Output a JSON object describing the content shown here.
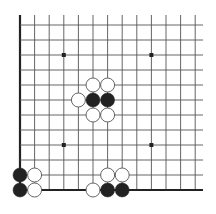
{
  "board": {
    "title": "Go board diagram (bottom-left corner)",
    "columns": 13,
    "rows": 12,
    "origin": {
      "x": 20,
      "y": 190
    },
    "spacing_x": 14.6,
    "spacing_y": 15,
    "grid_extend_right": 203,
    "grid_extend_top": 15,
    "edges": {
      "left": true,
      "bottom": true,
      "top": false,
      "right": false
    },
    "colors": {
      "background": "#ffffff",
      "grid_line": "#555555",
      "edge_line": "#222222",
      "black_stone": "#222222",
      "white_stone_fill": "#ffffff",
      "white_stone_stroke": "#555555",
      "star_point": "#222222"
    },
    "star_points": [
      {
        "col": 3,
        "row": 9
      },
      {
        "col": 9,
        "row": 9
      },
      {
        "col": 3,
        "row": 3
      },
      {
        "col": 9,
        "row": 3
      }
    ],
    "stones": [
      {
        "color": "black",
        "col": 0,
        "row": 0
      },
      {
        "color": "black",
        "col": 0,
        "row": 1
      },
      {
        "color": "white",
        "col": 1,
        "row": 0
      },
      {
        "color": "white",
        "col": 1,
        "row": 1
      },
      {
        "color": "white",
        "col": 5,
        "row": 7
      },
      {
        "color": "white",
        "col": 6,
        "row": 7
      },
      {
        "color": "white",
        "col": 4,
        "row": 6
      },
      {
        "color": "black",
        "col": 5,
        "row": 6
      },
      {
        "color": "black",
        "col": 6,
        "row": 6
      },
      {
        "color": "white",
        "col": 5,
        "row": 5
      },
      {
        "color": "white",
        "col": 6,
        "row": 5
      },
      {
        "color": "white",
        "col": 5,
        "row": 0
      },
      {
        "color": "black",
        "col": 6,
        "row": 0
      },
      {
        "color": "black",
        "col": 7,
        "row": 0
      },
      {
        "color": "white",
        "col": 6,
        "row": 1
      },
      {
        "color": "white",
        "col": 7,
        "row": 1
      }
    ]
  }
}
